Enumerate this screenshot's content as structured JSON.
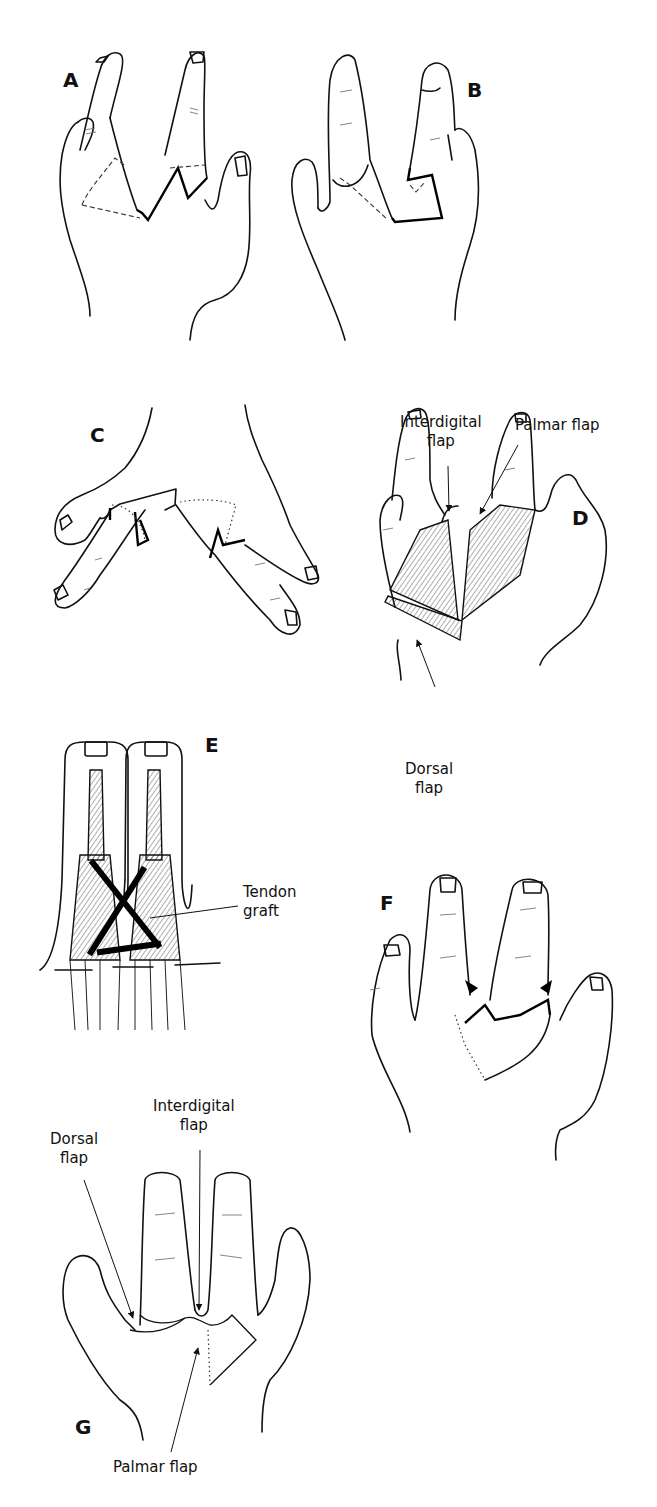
{
  "figure": {
    "panels": [
      {
        "id": "A",
        "letter": "A",
        "content": "Hand with flap incision markings (dashed outlines) on palmar aspect"
      },
      {
        "id": "B",
        "letter": "B",
        "content": "Hand showing rotated flap outlines"
      },
      {
        "id": "C",
        "letter": "C",
        "content": "Dorsal view of hand with dotted flap markings"
      },
      {
        "id": "D",
        "letter": "D",
        "content": "Raised flaps exposing web space",
        "labels": {
          "interdigital": [
            "Interdigital",
            "flap"
          ],
          "palmar": [
            "Palmar flap"
          ],
          "dorsal": [
            "Dorsal",
            "flap"
          ]
        }
      },
      {
        "id": "E",
        "letter": "E",
        "content": "Deep anatomy with crossed tendon graft",
        "labels": {
          "tendon_graft": [
            "Tendon",
            "graft"
          ]
        }
      },
      {
        "id": "F",
        "letter": "F",
        "content": "Flaps transposed into web space, arrows indicating direction"
      },
      {
        "id": "G",
        "letter": "G",
        "content": "Closed wound with sutured flaps",
        "labels": {
          "dorsal": [
            "Dorsal",
            "flap"
          ],
          "interdigital": [
            "Interdigital",
            "flap"
          ],
          "palmar": [
            "Palmar flap"
          ]
        }
      }
    ]
  },
  "icons": {
    "arrow": "arrow-icon",
    "suture": "suture-line-icon"
  }
}
